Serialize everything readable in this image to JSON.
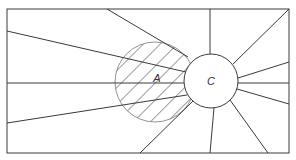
{
  "diagram": {
    "labels": {
      "hatched_region": "A",
      "center_circle": "C"
    },
    "colors": {
      "stroke": "#3a3a3a",
      "background": "#ffffff"
    },
    "frame": {
      "x": 7,
      "y": 9,
      "width": 282,
      "height": 144
    },
    "circle_c": {
      "cx": 211,
      "cy": 81,
      "r": 27
    },
    "circle_a": {
      "cx": 155,
      "cy": 82,
      "r": 40,
      "fill": "hatched"
    },
    "rays_count": 12
  }
}
